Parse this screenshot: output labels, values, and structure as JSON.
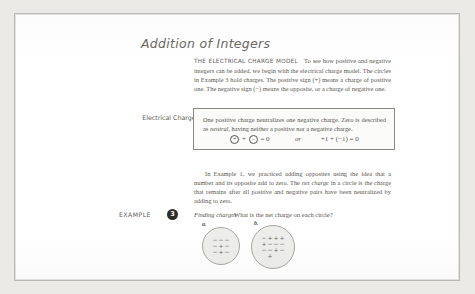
{
  "page": {
    "section_title": "Addition of Integers"
  },
  "intro": {
    "heading": "THE ELECTRICAL CHARGE MODEL",
    "text": "To see how positive and negative integers can be added, we begin with the electrical charge model. The circles in Example 3 hold charges. The positive sign (+) means a charge of positive one. The negative sign (−) means the opposite, or a charge of negative one."
  },
  "margin": {
    "label": "Electrical Charges"
  },
  "rule_box": {
    "line1": "One positive charge neutralizes one negative charge. Zero is described as",
    "line2_italic": "neutral",
    "line2_rest": ", having neither a positive nor a negative charge.",
    "equation": {
      "positive_symbol": "+",
      "negative_symbol": "−",
      "plus": "+",
      "equals": "= 0",
      "or": "or",
      "numeric": "+1 + (−1) = 0"
    }
  },
  "paragraph2": {
    "lead": "In Example 1, we practiced adding opposites using the idea that a number and its opposite add to zero. The ",
    "italic_term": "net charge",
    "tail": " in a circle is the charge that remains after all positive and negative pairs have been neutralized by adding to zero."
  },
  "example": {
    "label": "EXAMPLE",
    "number": "3",
    "title": "Finding charges",
    "question": "What is the net charge on each circle?",
    "figures": [
      {
        "letter": "a.",
        "rows": [
          [
            "−",
            "−",
            "−"
          ],
          [
            "−",
            "+",
            "−"
          ],
          [
            "−",
            "+",
            "−"
          ]
        ]
      },
      {
        "letter": "b.",
        "rows": [
          [
            "−",
            "+",
            "+",
            "+"
          ],
          [
            "+",
            "−",
            "−",
            "−"
          ],
          [
            "−",
            "−",
            "+",
            "−"
          ],
          [
            "",
            "+",
            "",
            ""
          ]
        ]
      }
    ]
  },
  "colors": {
    "page_background": "#eceae6",
    "sheet": "#ffffff",
    "ink": "#57544e",
    "badge": "#2e2c29",
    "circle_fill": "#ededeb"
  }
}
